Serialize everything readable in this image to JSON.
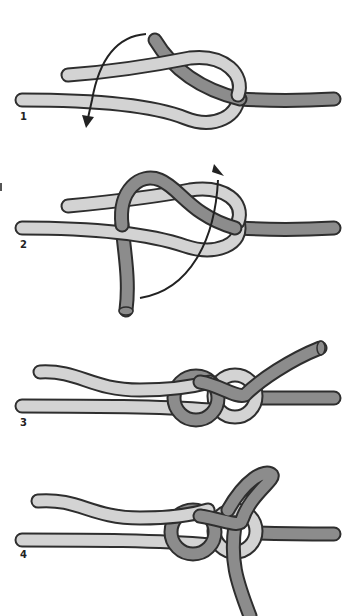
{
  "colors": {
    "light_rope": "#d3d3d3",
    "dark_rope": "#8c8c8c",
    "outline": "#2e2e2e",
    "arrow": "#222222",
    "background": "#ffffff"
  },
  "steps": [
    {
      "label": "1",
      "description": "Light rope forms a loop; dark rope end passes through loop; arrow indicates downward motion"
    },
    {
      "label": "2",
      "description": "Dark rope wraps around both light strands; curved arrow indicates passing end up through loop"
    },
    {
      "label": "3",
      "description": "Knot formed with dark end pointing up-right"
    },
    {
      "label": "4",
      "description": "Dark end doubled back and tucked, tail hanging down"
    }
  ]
}
